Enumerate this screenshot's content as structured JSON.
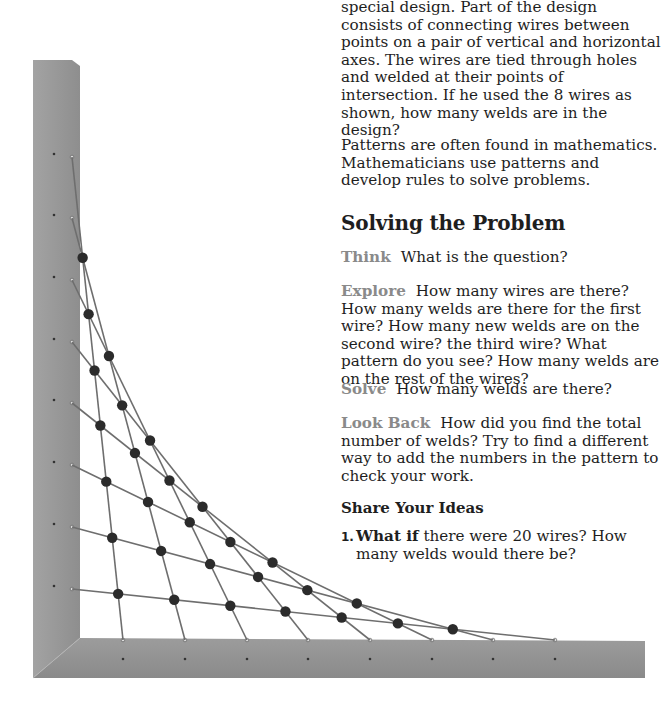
{
  "problem": {
    "intro_text": "special design. Part of the design consists of connecting wires between points on a pair of vertical and horizontal axes. The wires are tied through holes and welded at their points of intersection. If he used the 8 wires as shown, how many welds are in the design?",
    "patterns_text": "Patterns are often found in mathematics. Mathematicians use patterns and develop rules to solve problems."
  },
  "solving": {
    "heading": "Solving the Problem",
    "steps": [
      {
        "label": "Think",
        "text": "What is the question?"
      },
      {
        "label": "Explore",
        "text": "How many wires are there? How many welds are there for the first wire? How many new welds are on the second wire? the third wire? What pattern do you see? How many welds are on the rest of the wires?"
      },
      {
        "label": "Solve",
        "text": "How many welds are there?"
      },
      {
        "label": "Look Back",
        "text": "How did you find the total number of welds? Try to find a different way to add the numbers in the pattern to check your work."
      }
    ]
  },
  "share": {
    "heading": "Share Your Ideas",
    "questions": [
      {
        "number": "1.",
        "lead": "What if",
        "text": "there were 20 wires? How many welds would there be?"
      }
    ]
  },
  "figure": {
    "wire_count": 8,
    "vertical_anchor_x": 72,
    "vertical_anchor_ys": [
      157,
      218,
      280,
      342,
      403,
      465,
      527,
      589
    ],
    "horizontal_anchor_y": 640,
    "horizontal_anchor_xs": [
      123,
      185,
      247,
      308,
      370,
      432,
      493,
      555
    ],
    "colors": {
      "board": "#9a9a9a",
      "board_dark": "#7e7e7e",
      "wire": "#6e6e6e",
      "weld": "#2b2b2b"
    }
  }
}
